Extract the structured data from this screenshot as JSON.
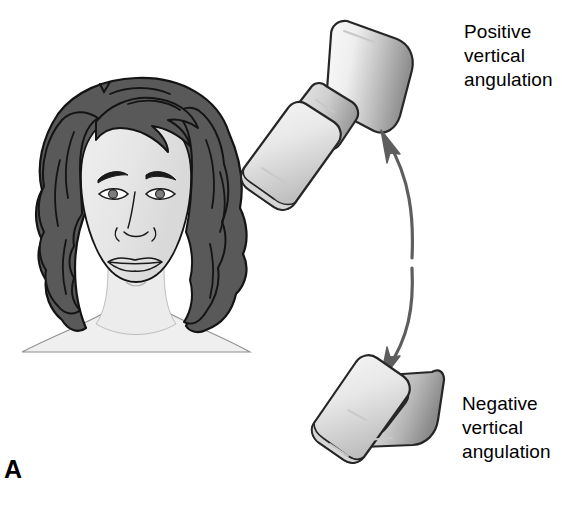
{
  "figure": {
    "panel_label": "A",
    "background_color": "#ffffff"
  },
  "annotations": {
    "positive": {
      "line1": "Positive",
      "line2": "vertical",
      "line3": "angulation",
      "text": "Positive\nvertical\nangulation"
    },
    "negative": {
      "line1": "Negative",
      "line2": "vertical",
      "line3": "angulation",
      "text": "Negative\nvertical\nangulation"
    }
  },
  "illustrations": {
    "patient_head": {
      "name": "frontal portrait of patient",
      "hair_color": "#595959",
      "skin_color": "#e6e6e6",
      "neck_color": "#efefef",
      "outline_color": "#1a1a1a"
    },
    "tubehead_upper": {
      "name": "x-ray tubehead angled upward",
      "body_light": "#f2f2f2",
      "body_dark": "#969696",
      "outline_color": "#262626"
    },
    "tubehead_lower": {
      "name": "x-ray tubehead angled downward",
      "body_light": "#f2f2f2",
      "body_dark": "#969696",
      "outline_color": "#262626"
    },
    "rotation_arrow": {
      "name": "double headed curved arrow",
      "color": "#5e5e5e"
    }
  }
}
